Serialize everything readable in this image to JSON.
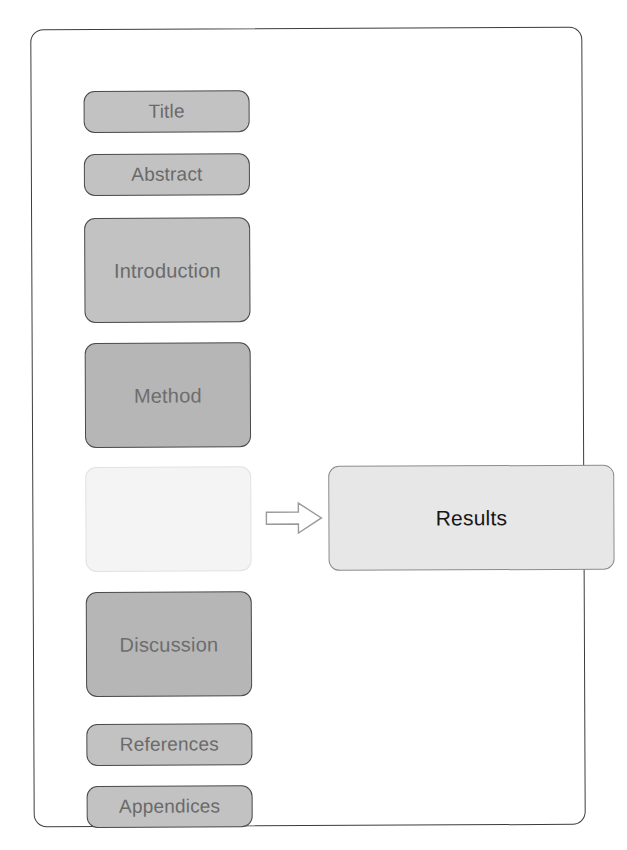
{
  "diagram": {
    "frame": {
      "name": "page-outline"
    },
    "colors": {
      "box_fill_light": "#c2c2c2",
      "box_fill_mid": "#b6b6b6",
      "box_fill_empty": "#f4f4f4",
      "box_fill_results": "#e7e7e7",
      "box_border": "#4a4a4a",
      "results_border": "#8c8c8c",
      "label_text": "#6a6a6a",
      "results_text": "#161616",
      "frame_border": "#3c3c3c",
      "arrow_stroke": "#9a9a9a",
      "arrow_fill": "#ffffff"
    },
    "sections": [
      {
        "id": "title",
        "label": "Title"
      },
      {
        "id": "abstract",
        "label": "Abstract"
      },
      {
        "id": "introduction",
        "label": "Introduction"
      },
      {
        "id": "method",
        "label": "Method"
      },
      {
        "id": "blank",
        "label": ""
      },
      {
        "id": "discussion",
        "label": "Discussion"
      },
      {
        "id": "references",
        "label": "References"
      },
      {
        "id": "appendices",
        "label": "Appendices"
      }
    ],
    "highlight": {
      "id": "results",
      "label": "Results"
    },
    "connector": {
      "id": "arrow",
      "label": "",
      "direction": "right",
      "icon": "block-arrow-right-icon"
    }
  }
}
